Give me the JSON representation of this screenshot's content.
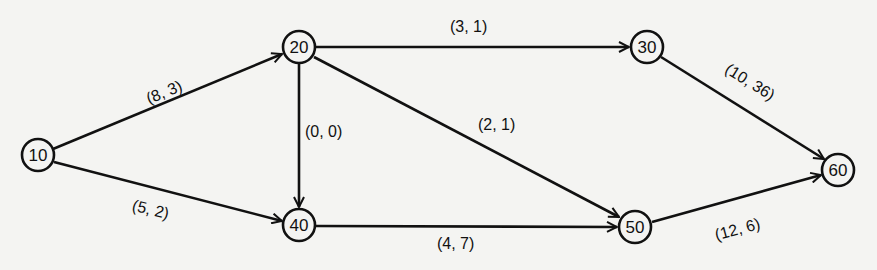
{
  "diagram": {
    "type": "activity-network",
    "nodes": [
      {
        "id": "10",
        "label": "10",
        "x": 38,
        "y": 155
      },
      {
        "id": "20",
        "label": "20",
        "x": 299,
        "y": 47
      },
      {
        "id": "30",
        "label": "30",
        "x": 647,
        "y": 47
      },
      {
        "id": "40",
        "label": "40",
        "x": 299,
        "y": 225
      },
      {
        "id": "50",
        "label": "50",
        "x": 635,
        "y": 227
      },
      {
        "id": "60",
        "label": "60",
        "x": 838,
        "y": 170
      }
    ],
    "edges": [
      {
        "from": "10",
        "to": "20",
        "label": "(8, 3)"
      },
      {
        "from": "10",
        "to": "40",
        "label": "(5, 2)"
      },
      {
        "from": "20",
        "to": "30",
        "label": "(3, 1)"
      },
      {
        "from": "20",
        "to": "40",
        "label": "(0, 0)"
      },
      {
        "from": "20",
        "to": "50",
        "label": "(2, 1)"
      },
      {
        "from": "40",
        "to": "50",
        "label": "(4, 7)"
      },
      {
        "from": "30",
        "to": "60",
        "label": "(10, 36)"
      },
      {
        "from": "50",
        "to": "60",
        "label": "(12, 6)"
      }
    ]
  }
}
